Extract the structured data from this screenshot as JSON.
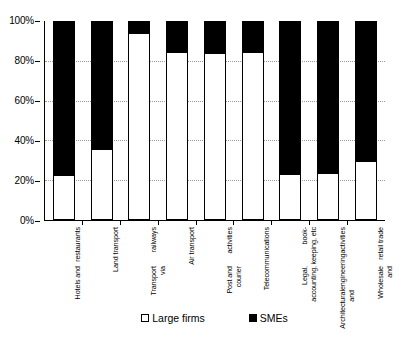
{
  "chart_data": {
    "type": "bar",
    "subtype": "stacked-percentage",
    "title": "",
    "xlabel": "",
    "ylabel": "",
    "ylim": [
      0,
      100
    ],
    "ytick_labels": [
      "0%",
      "20%",
      "40%",
      "60%",
      "80%",
      "100%"
    ],
    "ytick_values": [
      0,
      20,
      40,
      60,
      80,
      100
    ],
    "grid": true,
    "grid_axis": "y",
    "legend_position": "bottom",
    "categories": [
      "Hotels and restaurants",
      "Land transport",
      "Transport via railways",
      "Air transport",
      "Post and courier activities",
      "Telecommunications",
      "Legal, accounting, book-keeping, etc",
      "Architectural and engineering activities",
      "Wholesale and retail trade"
    ],
    "category_lines": [
      [
        "Hotels and",
        "restaurants"
      ],
      [
        "Land transport"
      ],
      [
        "Transport via",
        "railways"
      ],
      [
        "Air transport"
      ],
      [
        "Post and courier",
        "activities"
      ],
      [
        "Telecommunications"
      ],
      [
        "Legal, accounting,",
        "book-keeping, etc"
      ],
      [
        "Architectural and",
        "engineering",
        "activities"
      ],
      [
        "Wholesale and",
        "retail trade"
      ]
    ],
    "series": [
      {
        "name": "Large firms",
        "color": "#ffffff",
        "values": [
          22.5,
          35.5,
          94.5,
          85.0,
          84.5,
          85.0,
          23.0,
          23.5,
          29.5
        ]
      },
      {
        "name": "SMEs",
        "color": "#000000",
        "values": [
          77.5,
          64.5,
          5.5,
          15.0,
          15.5,
          15.0,
          77.0,
          76.5,
          70.5
        ]
      }
    ]
  },
  "legend": {
    "items": [
      {
        "label": "Large firms",
        "swatch": "white-square-icon"
      },
      {
        "label": "SMEs",
        "swatch": "black-square-icon"
      }
    ]
  }
}
